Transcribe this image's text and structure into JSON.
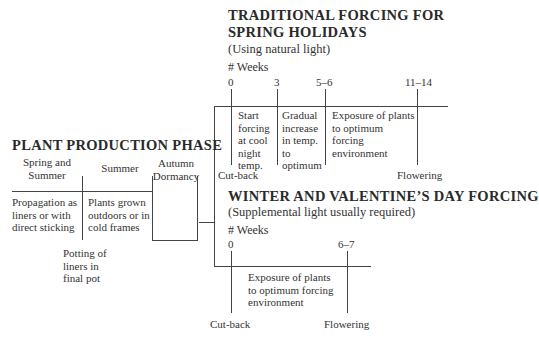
{
  "traditional": {
    "title_line1": "TRADITIONAL FORCING FOR",
    "title_line2": "SPRING HOLIDAYS",
    "subtitle": "(Using natural light)",
    "weeks_label": "# Weeks",
    "ticks": [
      "0",
      "3",
      "5–6",
      "11–14"
    ],
    "stages": [
      "Start forcing at cool night temp.",
      "Gradual increase in temp. to optimum",
      "Exposure of plants to optimum forcing environment"
    ],
    "start_event": "Cut-back",
    "end_event": "Flowering"
  },
  "production": {
    "title": "PLANT PRODUCTION PHASE",
    "seasons": [
      "Spring and Summer",
      "Summer",
      "Autumn Dormancy"
    ],
    "stages": [
      "Propagation as liners or with direct sticking",
      "Plants grown outdoors or in cold frames"
    ],
    "event": "Potting of liners in final pot"
  },
  "winter": {
    "title": "WINTER AND VALENTINE’S DAY FORCING",
    "subtitle": "(Supplemental light usually required)",
    "weeks_label": "# Weeks",
    "ticks": [
      "0",
      "6–7"
    ],
    "stages": [
      "Exposure of plants to optimum forcing environment"
    ],
    "start_event": "Cut-back",
    "end_event": "Flowering"
  }
}
